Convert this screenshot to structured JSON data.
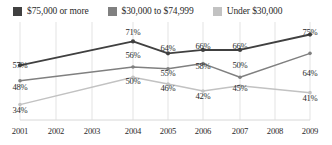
{
  "chart_data": {
    "type": "line",
    "title": "",
    "subtitle": "",
    "xlabel": "",
    "ylabel": "",
    "ylim": [
      25,
      80
    ],
    "grid": "vertical",
    "legend_position": "top-left",
    "categories": [
      "2001",
      "2002",
      "2003",
      "2004",
      "2005",
      "2006",
      "2007",
      "2008",
      "2009"
    ],
    "series": [
      {
        "name": "$75,000 or more",
        "color": "#404040",
        "values": [
          57,
          null,
          null,
          71,
          64,
          66,
          66,
          null,
          75
        ],
        "labels": [
          "57%",
          "",
          "",
          "71%",
          "64%",
          "66%",
          "66%",
          "",
          "75%"
        ]
      },
      {
        "name": "$30,000 to $74,999",
        "color": "#808080",
        "values": [
          48,
          null,
          null,
          56,
          55,
          58,
          50,
          null,
          64
        ],
        "labels": [
          "48%",
          "",
          "",
          "56%",
          "55%",
          "58%",
          "50%",
          "",
          "64%"
        ]
      },
      {
        "name": "Under $30,000",
        "color": "#c2c2c2",
        "values": [
          34,
          null,
          null,
          50,
          46,
          42,
          45,
          null,
          41
        ],
        "labels": [
          "34%",
          "",
          "",
          "50%",
          "46%",
          "42%",
          "45%",
          "",
          "41%"
        ]
      }
    ]
  },
  "legend": {
    "items": [
      {
        "label": "$75,000 or more",
        "color": "#404040"
      },
      {
        "label": "$30,000 to $74,999",
        "color": "#808080"
      },
      {
        "label": "Under $30,000",
        "color": "#c2c2c2"
      }
    ]
  },
  "xaxis": {
    "ticks": [
      "2001",
      "2002",
      "2003",
      "2004",
      "2005",
      "2006",
      "2007",
      "2008",
      "2009"
    ]
  },
  "data_labels": [
    {
      "text": "57%",
      "x": 20,
      "y": 39,
      "anchor": "above"
    },
    {
      "text": "71%",
      "x": 133,
      "y": 6,
      "anchor": "above"
    },
    {
      "text": "64%",
      "x": 168,
      "y": 22,
      "anchor": "above"
    },
    {
      "text": "66%",
      "x": 203,
      "y": 20,
      "anchor": "above"
    },
    {
      "text": "66%",
      "x": 240,
      "y": 20,
      "anchor": "above"
    },
    {
      "text": "75%",
      "x": 310,
      "y": 6,
      "anchor": "above"
    },
    {
      "text": "48%",
      "x": 20,
      "y": 61,
      "anchor": "below"
    },
    {
      "text": "56%",
      "x": 133,
      "y": 29,
      "anchor": "below"
    },
    {
      "text": "55%",
      "x": 168,
      "y": 47,
      "anchor": "below"
    },
    {
      "text": "58%",
      "x": 203,
      "y": 40,
      "anchor": "below"
    },
    {
      "text": "50%",
      "x": 240,
      "y": 39,
      "anchor": "above"
    },
    {
      "text": "64%",
      "x": 310,
      "y": 47,
      "anchor": "below"
    },
    {
      "text": "34%",
      "x": 20,
      "y": 84,
      "anchor": "below"
    },
    {
      "text": "50%",
      "x": 133,
      "y": 55,
      "anchor": "below"
    },
    {
      "text": "46%",
      "x": 168,
      "y": 62,
      "anchor": "below"
    },
    {
      "text": "42%",
      "x": 203,
      "y": 70,
      "anchor": "below"
    },
    {
      "text": "45%",
      "x": 240,
      "y": 62,
      "anchor": "above"
    },
    {
      "text": "41%",
      "x": 310,
      "y": 72,
      "anchor": "below"
    }
  ],
  "colors": {
    "high_income": "#404040",
    "mid_income": "#808080",
    "low_income": "#c2c2c2",
    "gridline": "#e3e3e3",
    "text": "#2b2b2b"
  }
}
